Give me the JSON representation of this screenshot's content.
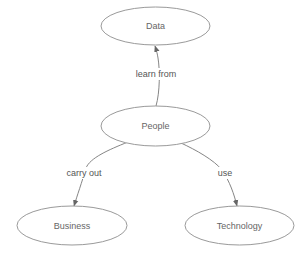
{
  "diagram": {
    "type": "concept-map",
    "colors": {
      "background": "#ffffff",
      "node_stroke": "#9a9a9a",
      "node_text": "#666666",
      "edge_stroke": "#777777",
      "edge_text": "#555555"
    },
    "nodes": [
      {
        "id": "data",
        "label": "Data"
      },
      {
        "id": "people",
        "label": "People"
      },
      {
        "id": "business",
        "label": "Business"
      },
      {
        "id": "technology",
        "label": "Technology"
      }
    ],
    "edges": [
      {
        "from": "people",
        "to": "data",
        "label": "learn from"
      },
      {
        "from": "people",
        "to": "business",
        "label": "carry out"
      },
      {
        "from": "people",
        "to": "technology",
        "label": "use"
      }
    ]
  }
}
